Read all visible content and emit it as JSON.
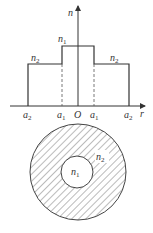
{
  "diagram": {
    "type": "step-index fiber refractive index profile",
    "profile": {
      "y_axis_label": "n",
      "x_axis_label": "r",
      "origin_label": "O",
      "core_label": {
        "base": "n",
        "sub": "1"
      },
      "cladding_left_label": {
        "base": "n",
        "sub": "2"
      },
      "cladding_right_label": {
        "base": "n",
        "sub": "2"
      },
      "x_ticks": [
        {
          "base": "a",
          "sub": "2"
        },
        {
          "base": "a",
          "sub": "1"
        },
        {
          "base": "O",
          "sub": ""
        },
        {
          "base": "a",
          "sub": "1"
        },
        {
          "base": "a",
          "sub": "2"
        }
      ]
    },
    "cross_section": {
      "inner_label": {
        "base": "n",
        "sub": "1"
      },
      "outer_label": {
        "base": "n",
        "sub": "2"
      },
      "hatched_region": "cladding (annulus)"
    },
    "colors": {
      "line": "#333333",
      "background": "#ffffff"
    }
  }
}
